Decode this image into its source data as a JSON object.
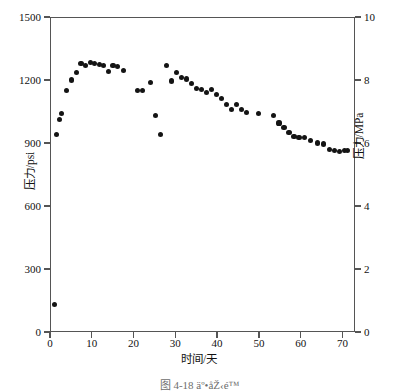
{
  "figure": {
    "caption": "图 4-18  äº•åŽ‹é™"
  },
  "chart_data": {
    "type": "scatter",
    "title": "",
    "xlabel": "时间/天",
    "ylabel": "压力/psi",
    "ylabel_secondary": "压力/MPa",
    "xlim": [
      0,
      73
    ],
    "ylim": [
      0,
      1500
    ],
    "ylim_secondary": [
      0,
      10
    ],
    "grid": false,
    "legend": null,
    "xticks": [
      0,
      10,
      20,
      30,
      40,
      50,
      60,
      70
    ],
    "xticklabels": [
      "0",
      "10",
      "20",
      "30",
      "40",
      "50",
      "60",
      "70"
    ],
    "yticks": [
      0,
      300,
      600,
      900,
      1200,
      1500
    ],
    "yticklabels": [
      "0",
      "300",
      "600",
      "900",
      "1200",
      "1500"
    ],
    "yticks_secondary": [
      0,
      2,
      4,
      6,
      8,
      10
    ],
    "yticklabels_secondary": [
      "0",
      "2",
      "4",
      "6",
      "8",
      "10"
    ],
    "marker": "filled-circle",
    "marker_color": "#141414",
    "axis_color": "#555555",
    "background_color": "#ffffff",
    "x": [
      1.0,
      1.6,
      2.2,
      2.8,
      4.0,
      5.2,
      6.3,
      7.4,
      8.5,
      9.6,
      10.7,
      11.8,
      12.9,
      14.0,
      15.1,
      16.2,
      17.5,
      21.0,
      22.2,
      24.0,
      25.3,
      26.5,
      27.8,
      29.0,
      30.2,
      31.4,
      32.6,
      33.8,
      35.0,
      36.2,
      37.4,
      38.6,
      39.8,
      41.0,
      42.2,
      43.4,
      44.6,
      45.8,
      47.0,
      50.0,
      53.5,
      54.8,
      56.0,
      57.2,
      58.4,
      59.6,
      61.0,
      62.4,
      64.0,
      65.5,
      66.8,
      68.0,
      69.2,
      70.4,
      71.2
    ],
    "y": [
      130,
      940,
      1010,
      1040,
      1150,
      1200,
      1235,
      1280,
      1270,
      1285,
      1280,
      1275,
      1270,
      1240,
      1270,
      1265,
      1245,
      1150,
      1150,
      1190,
      1030,
      940,
      1270,
      1195,
      1235,
      1210,
      1205,
      1185,
      1160,
      1155,
      1140,
      1155,
      1130,
      1110,
      1085,
      1060,
      1085,
      1060,
      1045,
      1040,
      1030,
      995,
      975,
      950,
      930,
      925,
      925,
      910,
      900,
      895,
      870,
      865,
      860,
      865,
      865
    ],
    "units_note": "Left axis psi; right axis MPa (1 MPa = 150 psi)"
  }
}
